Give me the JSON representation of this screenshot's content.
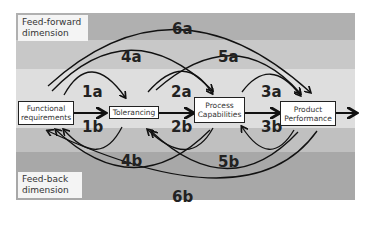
{
  "bands": [
    {
      "color": "#b0b0b0",
      "top": 13,
      "height": 27
    },
    {
      "color": "#c8c8c8",
      "top": 40,
      "height": 29
    },
    {
      "color": "#dedede",
      "top": 69,
      "height": 59
    },
    {
      "color": "#c0c0c0",
      "top": 128,
      "height": 24
    },
    {
      "color": "#a8a8a8",
      "top": 152,
      "height": 48
    }
  ],
  "labels": {
    "feedforward": "Feed-forward dimension",
    "feedback": "Feed-back dimension"
  },
  "boxes": {
    "functional": "Functional requirements",
    "tolerancing": "Tolerancing",
    "process": "Process Capabilities",
    "product": "Product Performance"
  },
  "arcs": {
    "a1": "1a",
    "b1": "1b",
    "a2": "2a",
    "b2": "2b",
    "a3": "3a",
    "b3": "3b",
    "a4": "4a",
    "b4": "4b",
    "a5": "5a",
    "b5": "5b",
    "a6": "6a",
    "b6": "6b"
  }
}
